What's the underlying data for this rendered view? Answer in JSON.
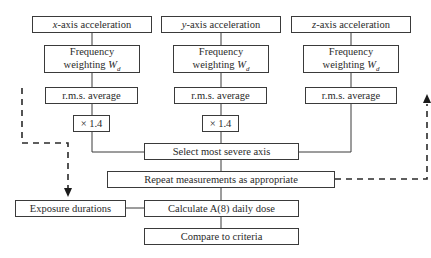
{
  "diagram": {
    "title": "",
    "columns": [
      {
        "axis_letter": "x",
        "acceleration_suffix": "-axis acceleration",
        "freq_line1": "Frequency",
        "freq_line2": "weighting",
        "weight_symbol": "W",
        "weight_sub": "d",
        "rms": "r.m.s. average",
        "multiplier": "× 1.4"
      },
      {
        "axis_letter": "y",
        "acceleration_suffix": "-axis acceleration",
        "freq_line1": "Frequency",
        "freq_line2": "weighting",
        "weight_symbol": "W",
        "weight_sub": "d",
        "rms": "r.m.s. average",
        "multiplier": "× 1.4"
      },
      {
        "axis_letter": "z",
        "acceleration_suffix": "-axis acceleration",
        "freq_line1": "Frequency",
        "freq_line2": "weighting",
        "weight_symbol": "W",
        "weight_sub": "d",
        "rms": "r.m.s. average"
      }
    ],
    "select_axis": "Select most severe axis",
    "repeat": "Repeat measurements as appropriate",
    "exposure": "Exposure durations",
    "calculate": "Calculate A(8) daily dose",
    "compare": "Compare to criteria",
    "colors": {
      "line": "#3a3a3a",
      "dashed": "#2a2a2a",
      "text": "#2a2a2a",
      "background": "#ffffff"
    }
  }
}
